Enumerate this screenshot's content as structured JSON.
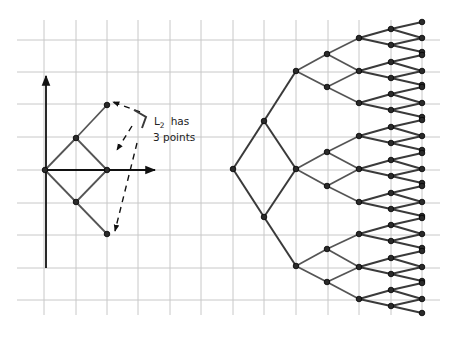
{
  "figure": {
    "annotation": {
      "line1_prefix": "L",
      "line1_sub": "2",
      "line1_suffix": "has",
      "line2": "3 points"
    },
    "colors": {
      "grid": "#c8c8c8",
      "edges": "#3a3a3a",
      "nodes": "#2a2a2a",
      "axes": "#111111"
    },
    "grid": {
      "x": [
        44,
        76,
        107,
        138,
        170,
        201,
        233,
        264,
        296,
        328,
        359,
        391,
        422
      ],
      "y": [
        40,
        72,
        104,
        137,
        170,
        203,
        235,
        268,
        300
      ],
      "x_extent": [
        17,
        440
      ],
      "y_extent": [
        20,
        315
      ]
    },
    "left_diagram": {
      "axes": {
        "vertical": {
          "x": 46,
          "y1": 268,
          "y2": 76
        },
        "horizontal": {
          "y": 170,
          "x1": 46,
          "x2": 155
        }
      },
      "nodes": [
        {
          "id": "o",
          "x": 45,
          "y": 170
        },
        {
          "id": "a",
          "x": 76,
          "y": 138
        },
        {
          "id": "b",
          "x": 76,
          "y": 202
        },
        {
          "id": "c",
          "x": 107,
          "y": 105
        },
        {
          "id": "d",
          "x": 107,
          "y": 170
        },
        {
          "id": "e",
          "x": 107,
          "y": 234
        }
      ],
      "edges": [
        [
          "o",
          "a"
        ],
        [
          "o",
          "b"
        ],
        [
          "a",
          "c"
        ],
        [
          "a",
          "d"
        ],
        [
          "b",
          "d"
        ],
        [
          "b",
          "e"
        ]
      ]
    },
    "right_tree": {
      "root": {
        "x": 233,
        "y": 169
      },
      "level1": [
        {
          "x": 264,
          "y": 121
        },
        {
          "x": 264,
          "y": 217
        }
      ],
      "level2": [
        {
          "x": 296,
          "y": 71
        },
        {
          "x": 296,
          "y": 169
        },
        {
          "x": 296,
          "y": 266
        }
      ],
      "level3": [
        {
          "x": 327,
          "y": 54,
          "parent": 0
        },
        {
          "x": 327,
          "y": 87,
          "parent": 0
        },
        {
          "x": 327,
          "y": 152,
          "parent": 1
        },
        {
          "x": 327,
          "y": 186,
          "parent": 1
        },
        {
          "x": 327,
          "y": 249,
          "parent": 2
        },
        {
          "x": 327,
          "y": 282,
          "parent": 2
        }
      ],
      "level4_y": [
        38,
        71,
        103,
        136,
        169,
        202,
        234,
        267,
        299
      ],
      "level4_x": 359,
      "level5_x": 391,
      "leaf_x": 422
    }
  }
}
